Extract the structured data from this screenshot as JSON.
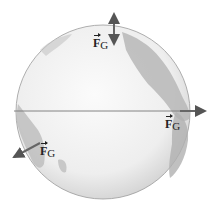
{
  "figure": {
    "globe": {
      "cx": 103,
      "cy": 112,
      "r": 87,
      "ocean_color": "#f1f1f1",
      "land_color": "#a9a9a9",
      "rim_color": "#8e8e8e"
    },
    "equator_line": {
      "x1": 14,
      "y1": 111,
      "x2": 205,
      "y2": 111,
      "color": "#777777"
    },
    "vectors": [
      {
        "id": "top",
        "label_main": "F",
        "label_sub": "G",
        "label_x": 76,
        "label_y": 37
      },
      {
        "id": "right",
        "label_main": "F",
        "label_sub": "G",
        "label_x": 163,
        "label_y": 119
      },
      {
        "id": "lower-left",
        "label_main": "F",
        "label_sub": "G",
        "label_x": 38,
        "label_y": 144
      }
    ],
    "arrow_color": "#666666"
  }
}
